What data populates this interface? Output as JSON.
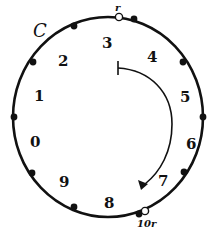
{
  "diagram": {
    "circle_label": "C",
    "circle": {
      "cx": 108,
      "cy": 117,
      "rx": 95,
      "ry": 100
    },
    "segment_labels": [
      {
        "text": "0",
        "x": 30,
        "y": 147
      },
      {
        "text": "1",
        "x": 34,
        "y": 101
      },
      {
        "text": "2",
        "x": 58,
        "y": 66
      },
      {
        "text": "3",
        "x": 102,
        "y": 48
      },
      {
        "text": "4",
        "x": 147,
        "y": 62
      },
      {
        "text": "5",
        "x": 180,
        "y": 102
      },
      {
        "text": "6",
        "x": 186,
        "y": 149
      },
      {
        "text": "7",
        "x": 158,
        "y": 186
      },
      {
        "text": "8",
        "x": 104,
        "y": 208
      },
      {
        "text": "9",
        "x": 59,
        "y": 187
      }
    ],
    "markers": [
      {
        "type": "open",
        "x": 119,
        "y": 17,
        "label": "r",
        "lx": 115,
        "ly": 11
      },
      {
        "type": "filled",
        "x": 134,
        "y": 19
      },
      {
        "type": "filled",
        "x": 183,
        "y": 62
      },
      {
        "type": "filled",
        "x": 203,
        "y": 117
      },
      {
        "type": "filled",
        "x": 184,
        "y": 172
      },
      {
        "type": "filled",
        "x": 139,
        "y": 214
      },
      {
        "type": "open",
        "x": 145,
        "y": 211,
        "label": "10r",
        "lx": 137,
        "ly": 227
      },
      {
        "type": "filled",
        "x": 74,
        "y": 207
      },
      {
        "type": "filled",
        "x": 32,
        "y": 173
      },
      {
        "type": "filled",
        "x": 14,
        "y": 117
      },
      {
        "type": "filled",
        "x": 33,
        "y": 62
      },
      {
        "type": "filled",
        "x": 74,
        "y": 26
      }
    ],
    "arrow": {
      "start_bar_x": 118,
      "start_y": 68,
      "direction": "clockwise"
    }
  }
}
